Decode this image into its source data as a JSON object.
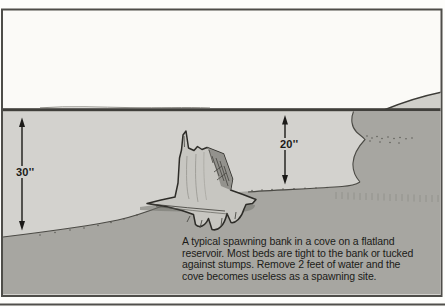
{
  "figure": {
    "title_implicit": "Spawning bank cross-section",
    "depth_labels": {
      "left": "30''",
      "right": "20''"
    },
    "caption_lines": [
      "A typical spawning bank in a cove on a flatland",
      "reservoir. Most beds are tight to the bank or tucked",
      "against stumps. Remove 2 feet of water and the",
      "cove becomes useless as a spawning site."
    ],
    "colors": {
      "sky": "#fbfaf7",
      "water": "#d3d2ce",
      "lake_bed": "#a7a6a1",
      "shore_land": "#d0cfca",
      "outline": "#2d2c28",
      "frame_border": "#4e4d49",
      "text": "#1b1b18"
    }
  }
}
